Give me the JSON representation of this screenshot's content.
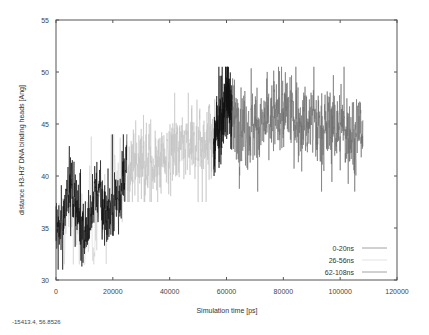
{
  "chart_data": {
    "type": "line",
    "title": "",
    "xlabel": "Simulation time [ps]",
    "ylabel": "distance H3-H3' DNA binding heads [Ang]",
    "xlim": [
      0,
      120000
    ],
    "ylim": [
      30,
      55
    ],
    "xticks": [
      0,
      20000,
      40000,
      60000,
      80000,
      100000,
      120000
    ],
    "yticks": [
      30,
      35,
      40,
      45,
      50,
      55
    ],
    "grid": false,
    "legend_position": "lower right",
    "series": [
      {
        "name": "0-20ns",
        "color": "#111111",
        "segments": [
          {
            "x_start": 0,
            "x_end": 25000,
            "trend": [
              [
                0,
                34.5
              ],
              [
                2000,
                34.8
              ],
              [
                4000,
                39.5
              ],
              [
                6000,
                38.5
              ],
              [
                8000,
                36.0
              ],
              [
                10000,
                34.5
              ],
              [
                12000,
                35.5
              ],
              [
                14000,
                39.5
              ],
              [
                16000,
                37.0
              ],
              [
                18000,
                36.5
              ],
              [
                20000,
                37.0
              ],
              [
                22000,
                38.0
              ],
              [
                24000,
                40.0
              ],
              [
                25000,
                42.0
              ]
            ],
            "noise": 1.4,
            "min": 31.0,
            "max": 44.0
          },
          {
            "x_start": 55500,
            "x_end": 62000,
            "trend": [
              [
                55500,
                41.5
              ],
              [
                57000,
                45.0
              ],
              [
                59000,
                47.0
              ],
              [
                61000,
                47.5
              ],
              [
                62000,
                46.0
              ]
            ],
            "noise": 1.8,
            "min": 40.0,
            "max": 50.5
          }
        ]
      },
      {
        "name": "26-56ns",
        "color": "#c4c4c4",
        "segments": [
          {
            "x_start": 1000,
            "x_end": 24000,
            "trend": [
              [
                1000,
                35.0
              ],
              [
                5000,
                36.5
              ],
              [
                10000,
                34.0
              ],
              [
                15000,
                37.0
              ],
              [
                20000,
                38.0
              ],
              [
                24000,
                39.5
              ]
            ],
            "noise": 2.2,
            "min": 31.5,
            "max": 44.0,
            "sparse": true
          },
          {
            "x_start": 25000,
            "x_end": 56000,
            "trend": [
              [
                25000,
                40.5
              ],
              [
                30000,
                41.5
              ],
              [
                35000,
                41.0
              ],
              [
                40000,
                42.0
              ],
              [
                45000,
                42.5
              ],
              [
                50000,
                43.0
              ],
              [
                55000,
                43.5
              ],
              [
                56000,
                44.5
              ]
            ],
            "noise": 1.6,
            "min": 37.5,
            "max": 48.0
          }
        ]
      },
      {
        "name": "62-108ns",
        "color": "#6e6e6e",
        "segments": [
          {
            "x_start": 62000,
            "x_end": 108000,
            "trend": [
              [
                62000,
                45.5
              ],
              [
                68000,
                44.5
              ],
              [
                74000,
                45.0
              ],
              [
                80000,
                46.0
              ],
              [
                86000,
                45.5
              ],
              [
                92000,
                44.5
              ],
              [
                98000,
                45.0
              ],
              [
                104000,
                44.0
              ],
              [
                108000,
                44.5
              ]
            ],
            "noise": 1.7,
            "min": 38.5,
            "max": 50.5
          }
        ]
      }
    ]
  },
  "status": {
    "cursor_coords": "-15413.4,  56.8526"
  }
}
